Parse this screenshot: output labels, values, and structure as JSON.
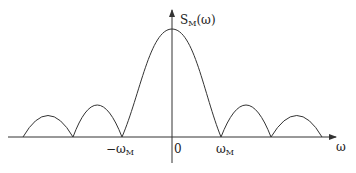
{
  "diagram": {
    "y_axis_label": {
      "main": "S",
      "sub": "M",
      "suffix": "(ω)"
    },
    "x_axis_label": "ω",
    "ticks": {
      "neg_wm": {
        "main": "−ω",
        "sub": "M"
      },
      "zero": "0",
      "pos_wm": {
        "main": "ω",
        "sub": "M"
      }
    },
    "colors": {
      "line": "#333333",
      "axis": "#333333",
      "background": "#ffffff"
    }
  }
}
